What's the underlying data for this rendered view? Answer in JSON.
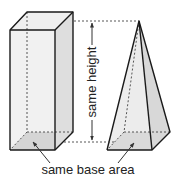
{
  "diagram": {
    "labels": {
      "height": "same height",
      "base": "same base area"
    },
    "shapes": {
      "prism": "rectangular prism",
      "pyramid": "square pyramid"
    },
    "colors": {
      "face_light": "#ececec",
      "face_side": "#dcdcdc",
      "base_shade": "#b5b5b5",
      "line": "#1a1a1a",
      "dash": "#444444"
    }
  }
}
